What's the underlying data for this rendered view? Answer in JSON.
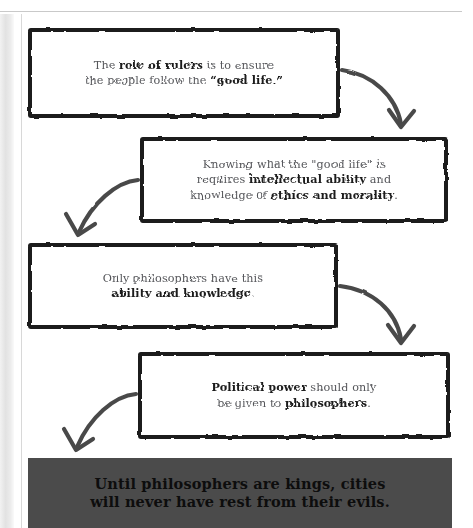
{
  "diagram": {
    "colors": {
      "box_border": "#1b1b1b",
      "box_fill": "#ffffff",
      "body_text": "#55565a",
      "emphasis_text": "#1b1b1b",
      "arrow": "#4a4a4a",
      "banner_background": "#4b4b4b",
      "banner_text": "#0d0d0d"
    },
    "steps": [
      {
        "id": "step-1",
        "name": "role-of-rulers",
        "lines": [
          [
            {
              "text": "The ",
              "emphasis": false
            },
            {
              "text": "role of rulers",
              "emphasis": true
            },
            {
              "text": " is to ensure",
              "emphasis": false
            }
          ],
          [
            {
              "text": "the people follow the ",
              "emphasis": false
            },
            {
              "text": "“good life.”",
              "emphasis": true
            }
          ]
        ],
        "plain_text": "The role of rulers is to ensure the people follow the “good life.”"
      },
      {
        "id": "step-2",
        "name": "good-life-requires-knowledge",
        "lines": [
          [
            {
              "text": "Knowing what the \"good life\" is",
              "emphasis": false
            }
          ],
          [
            {
              "text": "requires ",
              "emphasis": false
            },
            {
              "text": "intellectual ability",
              "emphasis": true
            },
            {
              "text": " and",
              "emphasis": false
            }
          ],
          [
            {
              "text": "knowledge of ",
              "emphasis": false
            },
            {
              "text": "ethics and morality",
              "emphasis": true
            },
            {
              "text": ".",
              "emphasis": false
            }
          ]
        ],
        "plain_text": "Knowing what the \"good life\" is requires intellectual ability and knowledge of ethics and morality."
      },
      {
        "id": "step-3",
        "name": "only-philosophers-have-this",
        "lines": [
          [
            {
              "text": "Only philosophers have this",
              "emphasis": false
            }
          ],
          [
            {
              "text": "ability and knowledge",
              "emphasis": true
            },
            {
              "text": ".",
              "emphasis": false
            }
          ]
        ],
        "plain_text": "Only philosophers have this ability and knowledge."
      },
      {
        "id": "step-4",
        "name": "political-power-to-philosophers",
        "lines": [
          [
            {
              "text": "Political power",
              "emphasis": true
            },
            {
              "text": " should only",
              "emphasis": false
            }
          ],
          [
            {
              "text": "be given to ",
              "emphasis": false
            },
            {
              "text": "philosophers",
              "emphasis": true
            },
            {
              "text": ".",
              "emphasis": false
            }
          ]
        ],
        "plain_text": "Political power should only be given to philosophers."
      }
    ],
    "arrows": [
      {
        "name": "arrow-step1-to-step2",
        "direction": "down-right"
      },
      {
        "name": "arrow-step2-to-step3",
        "direction": "down-left"
      },
      {
        "name": "arrow-step3-to-step4",
        "direction": "down-right"
      },
      {
        "name": "arrow-step4-to-conclusion",
        "direction": "down-left"
      }
    ],
    "conclusion": {
      "name": "conclusion-banner",
      "line_1": "Until philosophers are kings, cities",
      "line_2": "will never have rest from their evils.",
      "plain_text": "Until philosophers are kings, cities will never have rest from their evils."
    }
  }
}
